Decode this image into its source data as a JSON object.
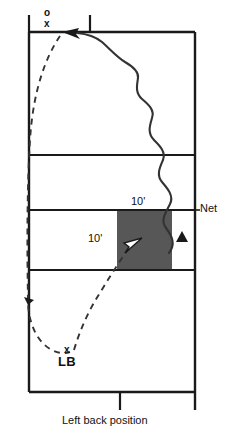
{
  "diagram": {
    "caption": "Left back position",
    "net_label": "Net",
    "labels": {
      "serve_origin_ball": "o",
      "serve_origin_player": "x",
      "left_back_marker": "x",
      "left_back_name": "LB",
      "distance_upper": "10'",
      "distance_lower": "10'"
    },
    "markers": {
      "target_triangle": "Δ"
    },
    "colors": {
      "shaded_zone": "#575757",
      "court_line": "#1a1a1a",
      "path_line": "#333333",
      "text": "#111111",
      "background": "#ffffff"
    },
    "icon_names": {
      "serve_path": "wavy-arrow-icon",
      "movement_path": "dashed-arrow-icon",
      "target_zone": "shaded-rectangle-icon"
    }
  }
}
